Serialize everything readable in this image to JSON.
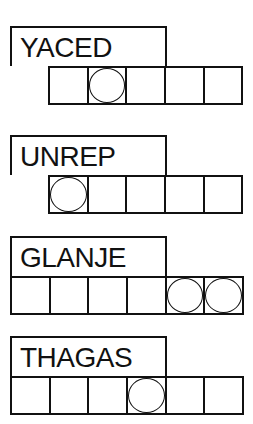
{
  "game": {
    "type": "word-jumble",
    "puzzles": [
      {
        "scrambled": "YACED",
        "answer_length": 5,
        "circled_indices": [
          1
        ],
        "entered_letters": [
          "",
          "",
          "",
          "",
          ""
        ],
        "cells_offset": "indented"
      },
      {
        "scrambled": "UNREP",
        "answer_length": 5,
        "circled_indices": [
          0
        ],
        "entered_letters": [
          "",
          "",
          "",
          "",
          ""
        ],
        "cells_offset": "indented"
      },
      {
        "scrambled": "GLANJE",
        "answer_length": 6,
        "circled_indices": [
          4,
          5
        ],
        "entered_letters": [
          "",
          "",
          "",
          "",
          "",
          ""
        ],
        "cells_offset": "flush"
      },
      {
        "scrambled": "THAGAS",
        "answer_length": 6,
        "circled_indices": [
          3
        ],
        "entered_letters": [
          "",
          "",
          "",
          "",
          "",
          ""
        ],
        "cells_offset": "flush"
      }
    ]
  },
  "colors": {
    "ink": "#111111",
    "background": "#ffffff"
  }
}
